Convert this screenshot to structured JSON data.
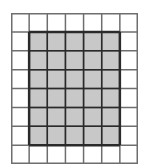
{
  "diagram": {
    "type": "grid",
    "columns": 7,
    "rows": 8,
    "shaded_region": {
      "col_start": 1,
      "row_start": 1,
      "cols": 5,
      "rows": 6
    },
    "colors": {
      "background": "#ffffff",
      "grid_line": "#6e6e6e",
      "shade_fill": "#c8c8c8",
      "shade_border": "#2a2a2a"
    }
  }
}
